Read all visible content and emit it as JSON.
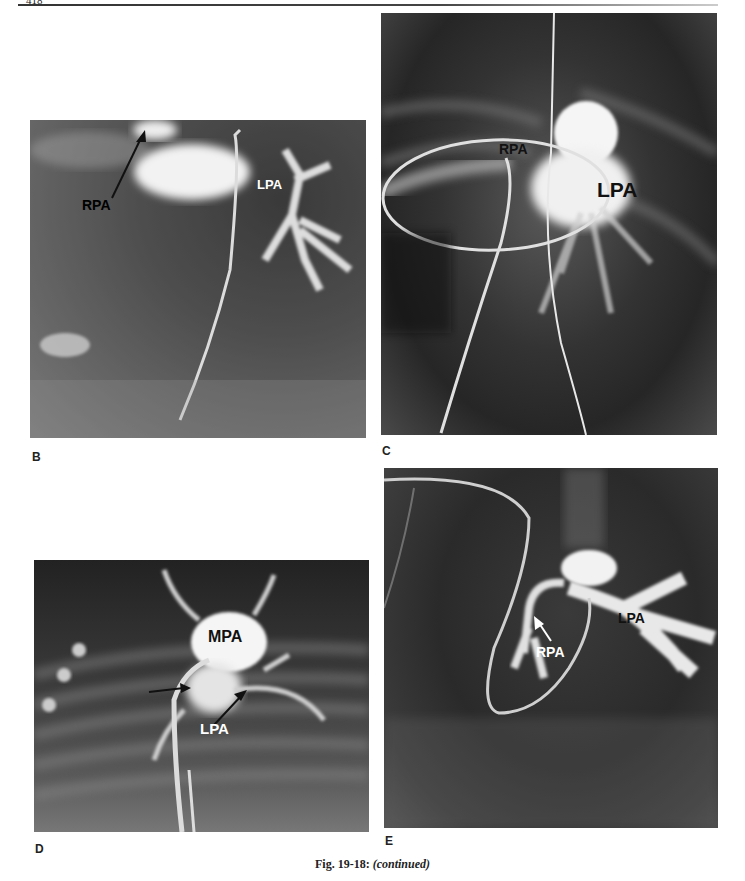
{
  "page": {
    "page_number": "418"
  },
  "figure": {
    "caption_number": "Fig. 19-18:",
    "caption_suffix": "(continued)",
    "panels": [
      {
        "letter": "B",
        "type": "angiogram",
        "labels": [
          {
            "text": "RPA",
            "color": "#111111"
          },
          {
            "text": "LPA",
            "color": "#ffffff"
          }
        ]
      },
      {
        "letter": "C",
        "type": "angiogram",
        "labels": [
          {
            "text": "RPA",
            "color": "#111111"
          },
          {
            "text": "LPA",
            "color": "#111111"
          }
        ]
      },
      {
        "letter": "D",
        "type": "angiogram",
        "labels": [
          {
            "text": "MPA",
            "color": "#111111"
          },
          {
            "text": "LPA",
            "color": "#ffffff"
          }
        ]
      },
      {
        "letter": "E",
        "type": "angiogram",
        "labels": [
          {
            "text": "RPA",
            "color": "#ffffff"
          },
          {
            "text": "LPA",
            "color": "#111111"
          }
        ]
      }
    ]
  }
}
